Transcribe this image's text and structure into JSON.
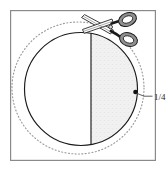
{
  "figure": {
    "frame": {
      "name": "diagram-frame",
      "x": 10,
      "y": 10,
      "width": 145,
      "height": 150,
      "stroke_color": "#8a8a8a",
      "stroke_width": 1.2,
      "fill_color": "#ffffff"
    },
    "solid_circle": {
      "name": "solid-circle",
      "cx": 81,
      "cy": 89,
      "r": 57,
      "stroke_color": "#1a1a1a",
      "stroke_width": 1.1,
      "fill_color": "#ffffff"
    },
    "dotted_circle": {
      "name": "dotted-outer-circle",
      "cx": 78,
      "cy": 88,
      "r": 66,
      "stroke_color": "#9a9a9a",
      "stroke_width": 1.1,
      "dash_pattern": "1 2.4"
    },
    "cut_line": {
      "name": "vertical-cut-line",
      "x": 91,
      "y_top": 33,
      "y_bottom": 145,
      "stroke_color": "#1a1a1a",
      "stroke_width": 1.1
    },
    "shaded_region": {
      "name": "shaded-right-half",
      "fill_color": "#efefef",
      "stipple_color": "#d2d2d2",
      "description": "right portion of circle right of the cut line"
    },
    "marker_dot": {
      "name": "quarter-point-marker",
      "cx": 135.5,
      "cy": 92,
      "r": 2.3,
      "fill_color": "#111111"
    },
    "leader_line": {
      "name": "label-leader-line",
      "x1": 137,
      "y1": 93,
      "x2": 153,
      "y2": 97,
      "stroke_color": "#4a4a4a",
      "stroke_width": 0.9
    },
    "scissors": {
      "name": "scissors-icon",
      "stroke_color": "#1a1a1a",
      "fill_color": "#9b9b9b",
      "blade_fill": "#ffffff",
      "description": "open scissors, blades pointing upper-left, two handle loops at right"
    }
  },
  "labels": {
    "fraction": "1/4",
    "fraction_numerator": "1",
    "fraction_denominator": "4"
  }
}
